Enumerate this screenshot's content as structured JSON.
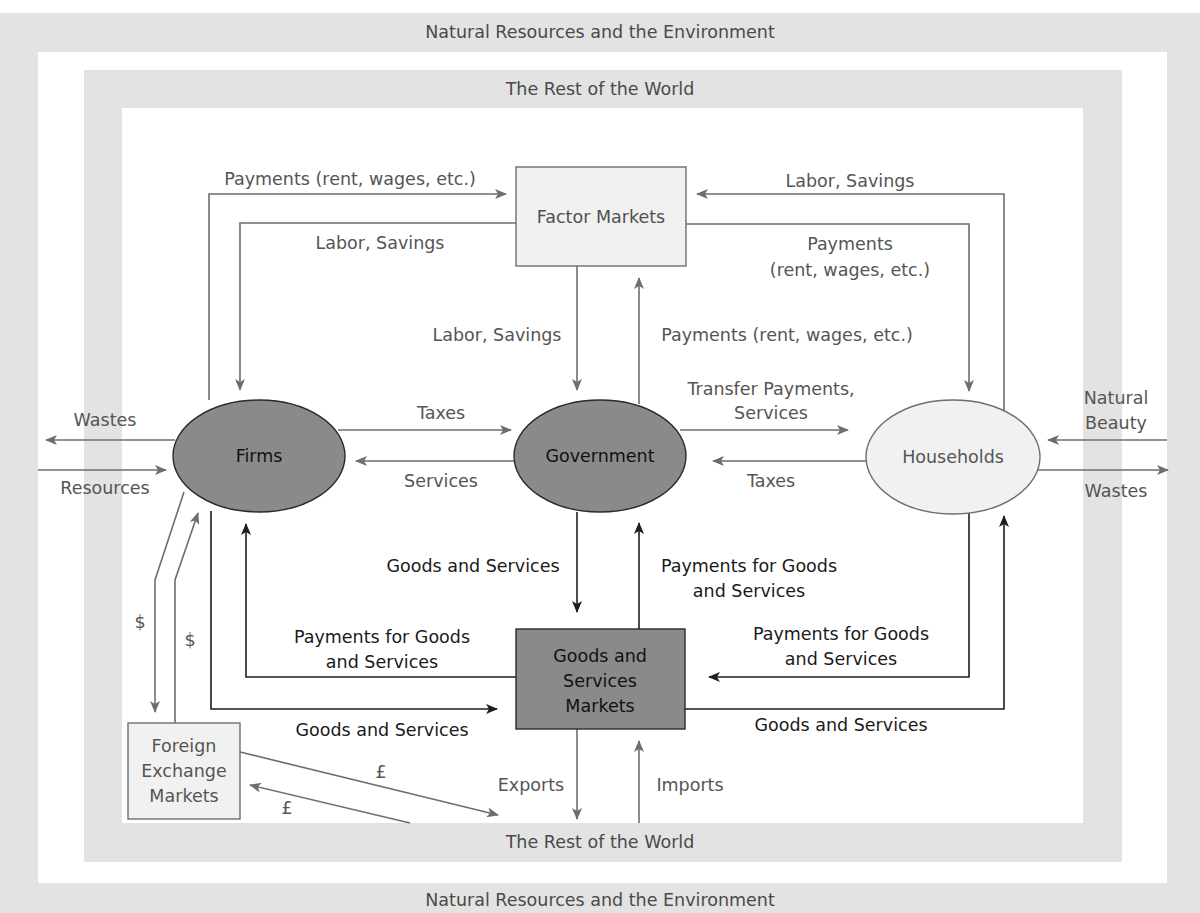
{
  "frame": {
    "outer_title_top": "Natural Resources and the Environment",
    "outer_title_bottom": "Natural Resources and the Environment",
    "inner_title_top": "The Rest of the World",
    "inner_title_bottom": "The Rest of the World"
  },
  "nodes": {
    "factor_markets": "Factor Markets",
    "firms": "Firms",
    "government": "Government",
    "households": "Households",
    "goods_markets": [
      "Goods and",
      "Services",
      "Markets"
    ],
    "foreign_exchange": [
      "Foreign",
      "Exchange",
      "Markets"
    ]
  },
  "flows": {
    "firms_to_factor_payments": "Payments (rent, wages, etc.)",
    "factor_to_firms_labor": "Labor, Savings",
    "households_to_factor_labor": "Labor, Savings",
    "factor_to_households_payments": [
      "Payments",
      "(rent, wages, etc.)"
    ],
    "factor_to_gov_labor": "Labor, Savings",
    "gov_to_factor_payments": "Payments (rent, wages, etc.)",
    "firms_to_gov_taxes": "Taxes",
    "gov_to_firms_services": "Services",
    "gov_to_households_transfers": [
      "Transfer Payments,",
      "Services"
    ],
    "households_to_gov_taxes": "Taxes",
    "firms_wastes": "Wastes",
    "firms_resources": "Resources",
    "households_natural_beauty": [
      "Natural",
      "Beauty"
    ],
    "households_wastes": "Wastes",
    "gov_to_goods_goods": "Goods and Services",
    "goods_to_gov_payments": [
      "Payments for Goods",
      "and Services"
    ],
    "goods_to_firms_payments": [
      "Payments for Goods",
      "and Services"
    ],
    "firms_to_goods_goods": "Goods and Services",
    "households_to_goods_payments": [
      "Payments for Goods",
      "and Services"
    ],
    "goods_to_households_goods": "Goods and Services",
    "firms_fx_dollar_out": "$",
    "firms_fx_dollar_in": "$",
    "fx_pound_out": "£",
    "fx_pound_in": "£",
    "exports": "Exports",
    "imports": "Imports"
  },
  "colors": {
    "band_gray": "#e3e3e3",
    "dark_node": "#8a8a8a",
    "light_node": "#f1f1f1",
    "line_gray": "#6e6e6e",
    "line_dark": "#1e1e1e"
  }
}
